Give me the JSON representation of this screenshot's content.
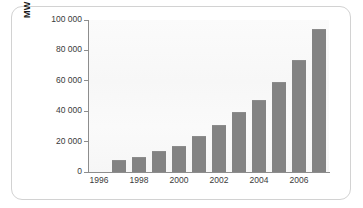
{
  "chart_data": {
    "type": "bar",
    "title": "",
    "subtitle": "",
    "xlabel": "",
    "ylabel": "MW",
    "categories": [
      "1996",
      "1997",
      "1998",
      "1999",
      "2000",
      "2001",
      "2002",
      "2003",
      "2004",
      "2005",
      "2006",
      "2007"
    ],
    "values": [
      0,
      7600,
      10200,
      13600,
      17400,
      23900,
      31100,
      39400,
      47600,
      59000,
      74000,
      94000
    ],
    "x_tick_labels": [
      "1996",
      "1998",
      "2000",
      "2002",
      "2004",
      "2006"
    ],
    "x_tick_categories": [
      "1996",
      "1998",
      "2000",
      "2002",
      "2004",
      "2006"
    ],
    "y_tick_labels": [
      "0",
      "20 000",
      "40 000",
      "60 000",
      "80 000",
      "100 000"
    ],
    "y_tick_values": [
      0,
      20000,
      40000,
      60000,
      80000,
      100000
    ],
    "ylim": [
      0,
      100000
    ],
    "grid": false,
    "legend": null,
    "legend_position": "none",
    "bar_color": "#838383",
    "plot_background": "#f8f8f8",
    "axis_color": "#8d8d8d",
    "text_color": "#3a3a3a",
    "frame_border_color": "#d2d2d2",
    "annotations": []
  },
  "axis": {
    "y_title": "MW"
  }
}
